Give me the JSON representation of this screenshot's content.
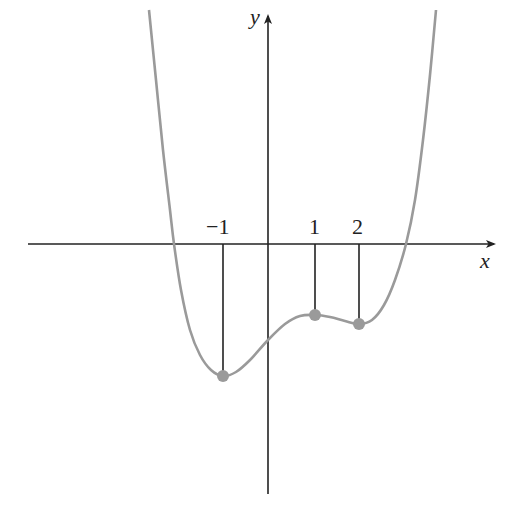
{
  "chart_data": {
    "type": "line",
    "title": "",
    "xlabel": "x",
    "ylabel": "y",
    "tick_labels": [
      "−1",
      "1",
      "2"
    ],
    "ticks": [
      -1,
      1,
      2
    ],
    "grid": false,
    "legend": null,
    "critical_points": [
      {
        "x": -1,
        "y": -2.9,
        "kind": "local minimum"
      },
      {
        "x": 1,
        "y": -1.55,
        "kind": "local maximum"
      },
      {
        "x": 2,
        "y": -1.75,
        "kind": "local minimum"
      }
    ],
    "x_intercepts": [
      -2.07,
      3.03
    ],
    "y_intercept": -2.1,
    "xlim": [
      -5.4,
      4.9
    ],
    "ylim": [
      -5.5,
      5.3
    ],
    "curve_color": "#9a9a9a",
    "axis_color": "#222222",
    "point_color": "#9a9a9a",
    "pixel_mapping": {
      "origin_px": [
        268,
        244
      ],
      "px_per_unit_x": 45.5,
      "px_per_unit_y": 45.5
    }
  },
  "labels": {
    "x_axis": "x",
    "y_axis": "y",
    "tick_neg1": "−1",
    "tick_1": "1",
    "tick_2": "2"
  }
}
